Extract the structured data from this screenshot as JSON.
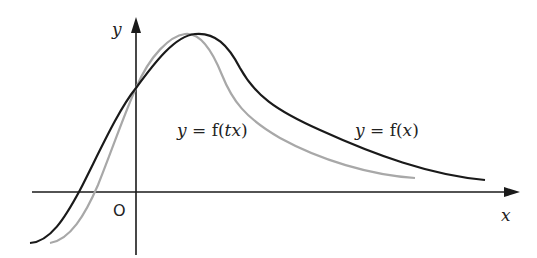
{
  "diagram": {
    "axes": {
      "x_label": "x",
      "y_label": "y",
      "origin_label": "O"
    },
    "curves": [
      {
        "name": "f(x)",
        "label": "y = f(x)",
        "color": "#1a1a1a"
      },
      {
        "name": "f(tx)",
        "label": "y = f(tx)",
        "color": "#a8a8a8"
      }
    ],
    "labels": {
      "ftx_y": "y",
      "ftx_eq": " = f(",
      "ftx_t": "t",
      "ftx_x": "x",
      "ftx_close": ")",
      "fx_y": "y",
      "fx_eq": " = f(",
      "fx_x": "x",
      "fx_close": ")"
    }
  }
}
